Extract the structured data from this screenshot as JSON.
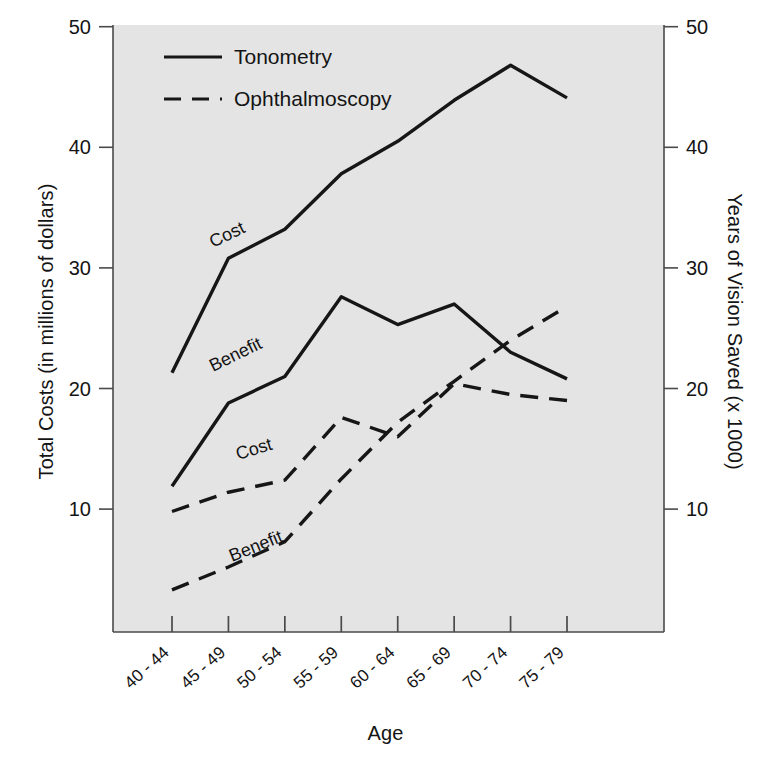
{
  "axes": {
    "xlabel": "Age",
    "ylabel_left": "Total Costs (in millions of dollars)",
    "ylabel_right": "Years of Vision Saved (x 1000)",
    "yticks_left": [
      "50",
      "40",
      "30",
      "20",
      "10"
    ],
    "yticks_right": [
      "50",
      "40",
      "30",
      "20",
      "10"
    ],
    "xticks": [
      "40 - 44",
      "45 - 49",
      "50 - 54",
      "55 - 59",
      "60 - 64",
      "65 - 69",
      "70 - 74",
      "75 - 79"
    ]
  },
  "legend": {
    "items": [
      {
        "label": "Tonometry",
        "style": "solid"
      },
      {
        "label": "Ophthalmoscopy",
        "style": "dashed"
      }
    ]
  },
  "annotations": {
    "tonometry_cost": "Cost",
    "tonometry_benefit": "Benefit",
    "ophthalmoscopy_cost": "Cost",
    "ophthalmoscopy_benefit": "Benefit"
  },
  "colors": {
    "plot_background": "#e4e4e4",
    "line": "#161616",
    "axis": "#4a4a4a",
    "page_background": "#ffffff"
  },
  "chart_data": {
    "type": "line",
    "title": "",
    "xlabel": "Age",
    "ylabel": "Total Costs (in millions of dollars)",
    "ylabel_secondary": "Years of Vision Saved (x 1000)",
    "categories": [
      "40 - 44",
      "45 - 49",
      "50 - 54",
      "55 - 59",
      "60 - 64",
      "65 - 69",
      "70 - 74",
      "75 - 79"
    ],
    "ylim": [
      0,
      50
    ],
    "yticks": [
      10,
      20,
      30,
      40,
      50
    ],
    "ylim_secondary": [
      0,
      50
    ],
    "yticks_secondary": [
      10,
      20,
      30,
      40,
      50
    ],
    "grid": false,
    "legend_position": "top-left inside",
    "series": [
      {
        "name": "Tonometry Cost",
        "group": "Tonometry",
        "measure": "Cost",
        "axis": "left",
        "style": "solid",
        "values": [
          21.3,
          30.8,
          33.2,
          37.8,
          40.5,
          43.9,
          46.8,
          44.1
        ]
      },
      {
        "name": "Tonometry Benefit",
        "group": "Tonometry",
        "measure": "Benefit",
        "axis": "right",
        "style": "solid",
        "values": [
          11.9,
          18.8,
          21.0,
          27.6,
          25.3,
          27.0,
          23.0,
          20.8
        ]
      },
      {
        "name": "Ophthalmoscopy Cost",
        "group": "Ophthalmoscopy",
        "measure": "Cost",
        "axis": "left",
        "style": "dashed",
        "values": [
          9.8,
          11.4,
          12.4,
          17.6,
          16.0,
          20.4,
          19.5,
          19.0
        ]
      },
      {
        "name": "Ophthalmoscopy Benefit",
        "group": "Ophthalmoscopy",
        "measure": "Benefit",
        "axis": "right",
        "style": "dashed",
        "values": [
          3.3,
          5.2,
          7.3,
          12.5,
          17.2,
          20.6,
          24.0,
          26.8
        ]
      }
    ]
  }
}
